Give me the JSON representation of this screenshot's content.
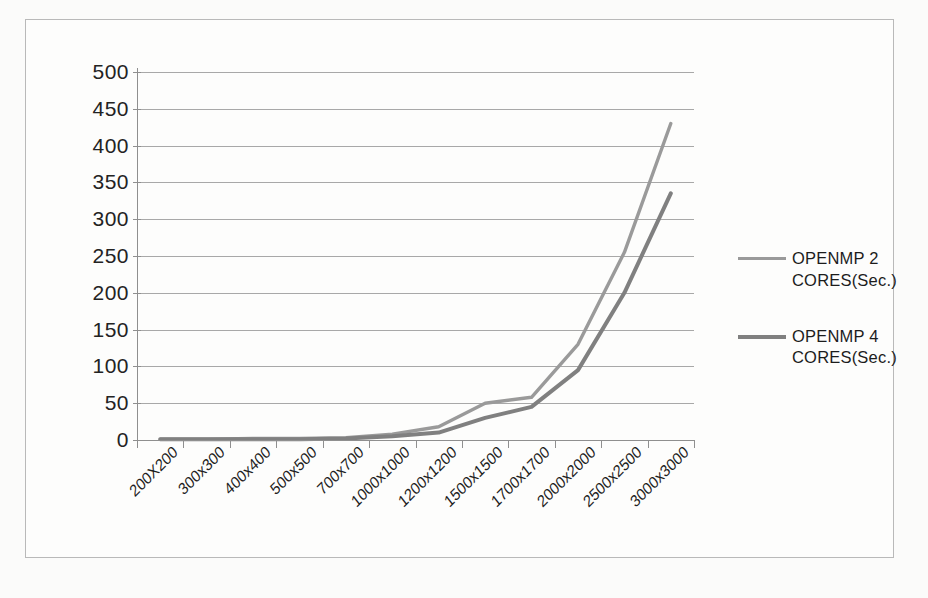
{
  "chart_data": {
    "type": "line",
    "title": "",
    "xlabel": "",
    "ylabel": "",
    "ylim": [
      0,
      500
    ],
    "ytick_step": 50,
    "grid": true,
    "legend_position": "right",
    "categories": [
      "200X200",
      "300x300",
      "400x400",
      "500x500",
      "700x700",
      "1000x1000",
      "1200x1200",
      "1500x1500",
      "1700x1700",
      "2000x2000",
      "2500x2500",
      "3000x3000"
    ],
    "yticks": [
      0,
      50,
      100,
      150,
      200,
      250,
      300,
      350,
      400,
      450,
      500
    ],
    "series": [
      {
        "name": "OPENMP 2 CORES(Sec.)",
        "color": "#9a9a9a",
        "values": [
          1,
          1,
          2,
          2,
          3,
          8,
          18,
          50,
          58,
          130,
          255,
          430
        ]
      },
      {
        "name": "OPENMP 4 CORES(Sec.)",
        "color": "#808080",
        "values": [
          1,
          1,
          1,
          1,
          2,
          5,
          10,
          30,
          45,
          95,
          200,
          335
        ]
      }
    ]
  },
  "legend": {
    "entries": [
      {
        "line1": "OPENMP 2",
        "line2": "CORES(Sec.)"
      },
      {
        "line1": "OPENMP 4",
        "line2": "CORES(Sec.)"
      }
    ]
  },
  "colors": {
    "series_1": "#9a9a9a",
    "series_2": "#808080",
    "gridline": "#a8a8a8",
    "axis": "#8f8f8f",
    "frame": "#b9b9b9",
    "background": "#fdfdfc",
    "text": "#1f1f1f"
  }
}
